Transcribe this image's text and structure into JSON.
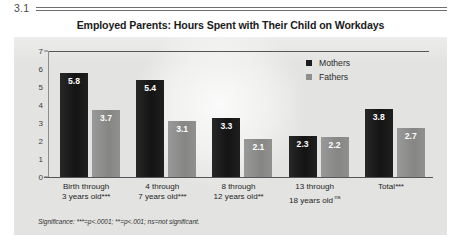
{
  "figure": {
    "number": "3.1",
    "title": "Employed Parents: Hours Spent with Their Child on Workdays",
    "footnote": "Significance: ***=p<.0001; **=p<.001; ns=not significant."
  },
  "legend": {
    "position": "top-right",
    "entries": [
      {
        "label": "Mothers",
        "color": "#1c1c1c"
      },
      {
        "label": "Fathers",
        "color": "#8e8e8c"
      }
    ]
  },
  "axis": {
    "y_ticks": [
      "7",
      "6",
      "5",
      "4",
      "3",
      "2",
      "1",
      "0"
    ]
  },
  "categories": [
    {
      "line1": "Birth through",
      "line2": "3 years old",
      "sig": "***",
      "sig_style": "stars"
    },
    {
      "line1": "4 through",
      "line2": "7 years old",
      "sig": "***",
      "sig_style": "stars"
    },
    {
      "line1": "8 through",
      "line2": "12 years old",
      "sig": "**",
      "sig_style": "stars"
    },
    {
      "line1": "13 through",
      "line2": "18 years old",
      "sig": "ns",
      "sig_style": "ns"
    },
    {
      "line1": "Total",
      "line2": "",
      "sig": "***",
      "sig_style": "stars"
    }
  ],
  "chart_data": {
    "type": "bar",
    "title": "Employed Parents: Hours Spent with Their Child on Workdays",
    "xlabel": "",
    "ylabel": "",
    "ylim": [
      0,
      7
    ],
    "grid": false,
    "legend_position": "top-right",
    "categories": [
      "Birth through 3 years old***",
      "4 through 7 years old***",
      "8 through 12 years old**",
      "13 through 18 years old ns",
      "Total***"
    ],
    "series": [
      {
        "name": "Mothers",
        "color": "#1c1c1c",
        "values": [
          5.8,
          5.4,
          3.3,
          2.3,
          3.8
        ]
      },
      {
        "name": "Fathers",
        "color": "#8e8e8c",
        "values": [
          3.7,
          3.1,
          2.1,
          2.2,
          2.7
        ]
      }
    ],
    "annotations": [
      "Significance: ***=p<.0001; **=p<.001; ns=not significant."
    ]
  }
}
